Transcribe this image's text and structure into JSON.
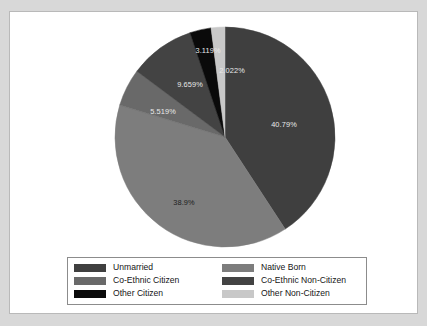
{
  "figure": {
    "background_color": "#ffffff",
    "page_background_color": "#d8d8d8",
    "border_color": "#b9b9b9"
  },
  "chart_data": {
    "type": "pie",
    "title": "",
    "subtitle": "",
    "xlabel": "",
    "ylabel": "",
    "grid": false,
    "legend_position": "bottom",
    "start_angle_deg": 90,
    "direction": "clockwise",
    "categories": [
      "Unmarried",
      "Native Born",
      "Co-Ethnic Citizen",
      "Co-Ethnic Non-Citizen",
      "Other Citizen",
      "Other Non-Citizen"
    ],
    "values": [
      40.79,
      38.9,
      5.519,
      9.659,
      3.119,
      2.022
    ],
    "value_labels": [
      "40.79%",
      "38.9%",
      "5.519%",
      "9.659%",
      "3.119%",
      "2.022%"
    ],
    "colors": [
      "#3f3f3f",
      "#7d7d7d",
      "#696969",
      "#434343",
      "#0a0a0a",
      "#c8c8c8"
    ],
    "slices": [
      {
        "name": "Unmarried",
        "value": 40.79,
        "label": "40.79%",
        "color": "#3f3f3f",
        "label_color": "on-dark",
        "label_x": 170,
        "label_y": 98
      },
      {
        "name": "Native Born",
        "value": 38.9,
        "label": "38.9%",
        "color": "#7d7d7d",
        "label_color": "on-light",
        "label_y": 176,
        "label_x": 70
      },
      {
        "name": "Co-Ethnic Citizen",
        "value": 5.519,
        "label": "5.519%",
        "color": "#696969",
        "label_color": "on-dark",
        "label_x": 49,
        "label_y": 85
      },
      {
        "name": "Co-Ethnic Non-Citizen",
        "value": 9.659,
        "label": "9.659%",
        "color": "#434343",
        "label_color": "on-dark",
        "label_x": 76,
        "label_y": 58
      },
      {
        "name": "Other Citizen",
        "value": 3.119,
        "label": "3.119%",
        "color": "#0a0a0a",
        "label_color": "on-dark",
        "label_x": 94,
        "label_y": 24
      },
      {
        "name": "Other Non-Citizen",
        "value": 2.022,
        "label": "2.022%",
        "color": "#c8c8c8",
        "label_color": "on-dark",
        "label_x": 118,
        "label_y": 44
      }
    ]
  },
  "legend": {
    "border_color": "#8c8c8c",
    "entries": [
      {
        "label": "Unmarried",
        "color": "#3f3f3f"
      },
      {
        "label": "Native Born",
        "color": "#7d7d7d"
      },
      {
        "label": "Co-Ethnic Citizen",
        "color": "#696969"
      },
      {
        "label": "Co-Ethnic Non-Citizen",
        "color": "#434343"
      },
      {
        "label": "Other Citizen",
        "color": "#0a0a0a"
      },
      {
        "label": "Other Non-Citizen",
        "color": "#c8c8c8"
      }
    ]
  }
}
